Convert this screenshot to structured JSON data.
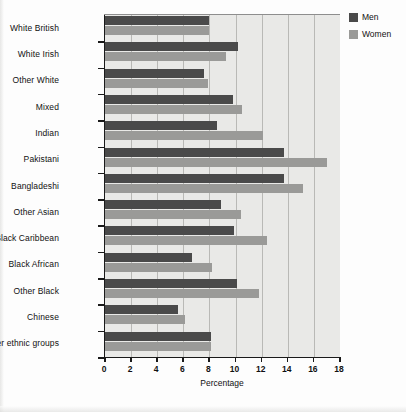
{
  "chart_data": {
    "type": "bar",
    "orientation": "horizontal",
    "title": "",
    "xlabel": "Percentage",
    "ylabel": "",
    "xlim": [
      0,
      18
    ],
    "xticks": [
      0,
      2,
      4,
      6,
      8,
      10,
      12,
      14,
      16,
      18
    ],
    "grid": true,
    "legend_position": "top-right",
    "categories": [
      "White British",
      "White Irish",
      "Other White",
      "Mixed",
      "Indian",
      "Pakistani",
      "Bangladeshi",
      "Other Asian",
      "Black Caribbean",
      "Black African",
      "Other Black",
      "Chinese",
      "Other ethnic groups"
    ],
    "series": [
      {
        "name": "Men",
        "color": "#4a4a4a",
        "values": [
          8.0,
          10.2,
          7.6,
          9.8,
          8.6,
          13.7,
          13.7,
          8.9,
          9.9,
          6.7,
          10.1,
          5.6,
          8.1
        ]
      },
      {
        "name": "Women",
        "color": "#9a9a98",
        "values": [
          8.0,
          9.3,
          7.9,
          10.5,
          12.1,
          17.0,
          15.2,
          10.4,
          12.4,
          8.2,
          11.8,
          6.1,
          8.1
        ]
      }
    ]
  },
  "legend": {
    "items": [
      {
        "label": "Men",
        "color": "#4a4a4a"
      },
      {
        "label": "Women",
        "color": "#9a9a98"
      }
    ]
  },
  "axis": {
    "x_title": "Percentage"
  }
}
